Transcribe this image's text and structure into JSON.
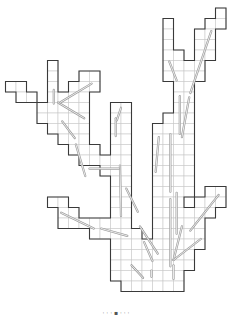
{
  "figure": {
    "type": "grid-tree-diagram",
    "colors": {
      "outline": "#3a3a3a",
      "grid": "#c9c9c9",
      "arrow": "#9a9a9a",
      "background": "#ffffff"
    },
    "cells": [
      [
        20,
        0
      ],
      [
        15,
        1
      ],
      [
        19,
        1
      ],
      [
        20,
        1
      ],
      [
        15,
        2
      ],
      [
        18,
        2
      ],
      [
        19,
        2
      ],
      [
        15,
        3
      ],
      [
        18,
        3
      ],
      [
        19,
        3
      ],
      [
        15,
        4
      ],
      [
        16,
        4
      ],
      [
        18,
        4
      ],
      [
        19,
        4
      ],
      [
        15,
        5
      ],
      [
        16,
        5
      ],
      [
        17,
        5
      ],
      [
        18,
        5
      ],
      [
        4,
        5
      ],
      [
        15,
        6
      ],
      [
        16,
        6
      ],
      [
        17,
        6
      ],
      [
        18,
        6
      ],
      [
        4,
        6
      ],
      [
        7,
        6
      ],
      [
        8,
        6
      ],
      [
        0,
        7
      ],
      [
        1,
        7
      ],
      [
        4,
        7
      ],
      [
        6,
        7
      ],
      [
        7,
        7
      ],
      [
        8,
        7
      ],
      [
        16,
        7
      ],
      [
        17,
        7
      ],
      [
        1,
        8
      ],
      [
        2,
        8
      ],
      [
        4,
        8
      ],
      [
        5,
        8
      ],
      [
        6,
        8
      ],
      [
        7,
        8
      ],
      [
        16,
        8
      ],
      [
        17,
        8
      ],
      [
        3,
        9
      ],
      [
        4,
        9
      ],
      [
        5,
        9
      ],
      [
        6,
        9
      ],
      [
        7,
        9
      ],
      [
        10,
        9
      ],
      [
        11,
        9
      ],
      [
        16,
        9
      ],
      [
        17,
        9
      ],
      [
        3,
        10
      ],
      [
        4,
        10
      ],
      [
        5,
        10
      ],
      [
        6,
        10
      ],
      [
        7,
        10
      ],
      [
        10,
        10
      ],
      [
        11,
        10
      ],
      [
        15,
        10
      ],
      [
        16,
        10
      ],
      [
        17,
        10
      ],
      [
        4,
        11
      ],
      [
        5,
        11
      ],
      [
        6,
        11
      ],
      [
        7,
        11
      ],
      [
        10,
        11
      ],
      [
        11,
        11
      ],
      [
        14,
        11
      ],
      [
        15,
        11
      ],
      [
        16,
        11
      ],
      [
        17,
        11
      ],
      [
        5,
        12
      ],
      [
        6,
        12
      ],
      [
        7,
        12
      ],
      [
        10,
        12
      ],
      [
        11,
        12
      ],
      [
        14,
        12
      ],
      [
        15,
        12
      ],
      [
        16,
        12
      ],
      [
        17,
        12
      ],
      [
        6,
        13
      ],
      [
        7,
        13
      ],
      [
        8,
        13
      ],
      [
        10,
        13
      ],
      [
        11,
        13
      ],
      [
        14,
        13
      ],
      [
        15,
        13
      ],
      [
        16,
        13
      ],
      [
        17,
        13
      ],
      [
        7,
        14
      ],
      [
        8,
        14
      ],
      [
        9,
        14
      ],
      [
        10,
        14
      ],
      [
        11,
        14
      ],
      [
        14,
        14
      ],
      [
        15,
        14
      ],
      [
        16,
        14
      ],
      [
        17,
        14
      ],
      [
        9,
        15
      ],
      [
        10,
        15
      ],
      [
        11,
        15
      ],
      [
        14,
        15
      ],
      [
        15,
        15
      ],
      [
        16,
        15
      ],
      [
        17,
        15
      ],
      [
        10,
        16
      ],
      [
        11,
        16
      ],
      [
        14,
        16
      ],
      [
        15,
        16
      ],
      [
        16,
        16
      ],
      [
        17,
        16
      ],
      [
        10,
        17
      ],
      [
        11,
        17
      ],
      [
        14,
        17
      ],
      [
        15,
        17
      ],
      [
        16,
        17
      ],
      [
        17,
        17
      ],
      [
        19,
        17
      ],
      [
        20,
        17
      ],
      [
        4,
        18
      ],
      [
        5,
        18
      ],
      [
        10,
        18
      ],
      [
        11,
        18
      ],
      [
        14,
        18
      ],
      [
        15,
        18
      ],
      [
        16,
        18
      ],
      [
        18,
        18
      ],
      [
        19,
        18
      ],
      [
        20,
        18
      ],
      [
        5,
        19
      ],
      [
        6,
        19
      ],
      [
        10,
        19
      ],
      [
        11,
        19
      ],
      [
        14,
        19
      ],
      [
        15,
        19
      ],
      [
        16,
        19
      ],
      [
        17,
        19
      ],
      [
        18,
        19
      ],
      [
        19,
        19
      ],
      [
        5,
        20
      ],
      [
        6,
        20
      ],
      [
        7,
        20
      ],
      [
        8,
        20
      ],
      [
        9,
        20
      ],
      [
        10,
        20
      ],
      [
        11,
        20
      ],
      [
        14,
        20
      ],
      [
        15,
        20
      ],
      [
        16,
        20
      ],
      [
        17,
        20
      ],
      [
        18,
        20
      ],
      [
        8,
        21
      ],
      [
        9,
        21
      ],
      [
        10,
        21
      ],
      [
        11,
        21
      ],
      [
        12,
        21
      ],
      [
        14,
        21
      ],
      [
        15,
        21
      ],
      [
        16,
        21
      ],
      [
        17,
        21
      ],
      [
        18,
        21
      ],
      [
        10,
        22
      ],
      [
        11,
        22
      ],
      [
        12,
        22
      ],
      [
        13,
        22
      ],
      [
        14,
        22
      ],
      [
        15,
        22
      ],
      [
        16,
        22
      ],
      [
        17,
        22
      ],
      [
        18,
        22
      ],
      [
        10,
        23
      ],
      [
        11,
        23
      ],
      [
        12,
        23
      ],
      [
        13,
        23
      ],
      [
        14,
        23
      ],
      [
        15,
        23
      ],
      [
        16,
        23
      ],
      [
        17,
        23
      ],
      [
        10,
        24
      ],
      [
        11,
        24
      ],
      [
        12,
        24
      ],
      [
        13,
        24
      ],
      [
        14,
        24
      ],
      [
        15,
        24
      ],
      [
        16,
        24
      ],
      [
        17,
        24
      ],
      [
        10,
        25
      ],
      [
        11,
        25
      ],
      [
        12,
        25
      ],
      [
        13,
        25
      ],
      [
        14,
        25
      ],
      [
        15,
        25
      ],
      [
        16,
        25
      ],
      [
        11,
        26
      ],
      [
        12,
        26
      ],
      [
        13,
        26
      ],
      [
        14,
        26
      ],
      [
        15,
        26
      ],
      [
        16,
        26
      ]
    ],
    "arrows": [
      [
        7.5,
        10.5,
        5.0,
        9.0
      ],
      [
        8.2,
        7.2,
        5.2,
        9.0
      ],
      [
        4.6,
        7.8,
        4.6,
        9.1
      ],
      [
        5.4,
        10.8,
        6.6,
        12.4
      ],
      [
        6.7,
        13.0,
        7.6,
        16.0
      ],
      [
        10.5,
        10.5,
        10.5,
        12.2
      ],
      [
        11.0,
        9.5,
        10.6,
        10.7
      ],
      [
        15.6,
        5.1,
        16.3,
        6.9
      ],
      [
        19.6,
        2.2,
        17.6,
        8.1
      ],
      [
        16.6,
        8.4,
        16.6,
        12.0
      ],
      [
        17.5,
        8.5,
        16.8,
        12.3
      ],
      [
        14.6,
        12.3,
        14.3,
        15.6
      ],
      [
        15.7,
        12.0,
        15.7,
        17.5
      ],
      [
        10.9,
        15.0,
        11.0,
        19.8
      ],
      [
        8.0,
        15.3,
        10.8,
        15.3
      ],
      [
        5.3,
        19.5,
        8.4,
        21.0
      ],
      [
        9.1,
        21.0,
        11.6,
        21.7
      ],
      [
        11.5,
        17.2,
        12.6,
        19.4
      ],
      [
        12.8,
        20.8,
        14.5,
        23.4
      ],
      [
        13.2,
        22.3,
        14.0,
        24.1
      ],
      [
        15.7,
        18.2,
        15.7,
        24.6
      ],
      [
        16.3,
        17.6,
        16.3,
        21.5
      ],
      [
        16.0,
        24.0,
        16.8,
        20.8
      ],
      [
        20.3,
        17.8,
        17.6,
        21.2
      ],
      [
        16.0,
        24.0,
        18.6,
        22.0
      ],
      [
        16.0,
        24.5,
        16.0,
        25.8
      ],
      [
        13.9,
        25.0,
        13.9,
        25.6
      ],
      [
        12.0,
        24.5,
        13.1,
        25.7
      ]
    ],
    "caption": "·  · ·   ▪ · ·    ·"
  }
}
